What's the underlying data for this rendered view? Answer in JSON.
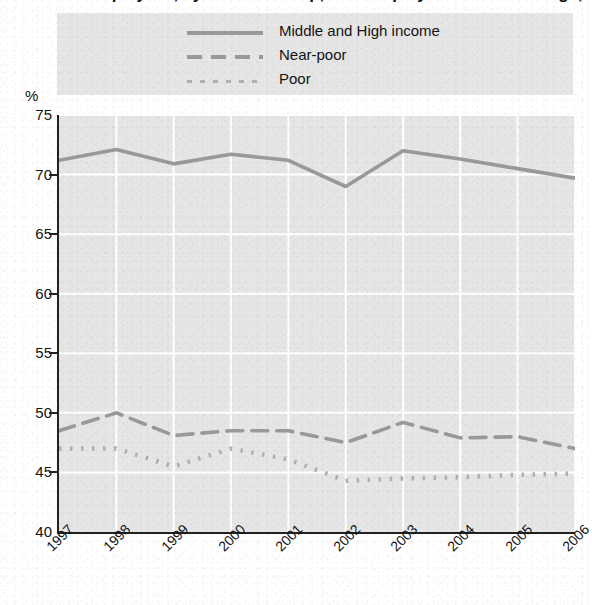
{
  "figure": {
    "title_remnant": "Percent of Employees, by Income Group, with Employer Health Coverage,",
    "percent_symbol": "%"
  },
  "legend": {
    "items": [
      {
        "label": "Middle and High income",
        "style": "solid",
        "color": "#9a9a9a"
      },
      {
        "label": "Near-poor",
        "style": "dashed",
        "color": "#9a9a9a"
      },
      {
        "label": "Poor",
        "style": "dotted",
        "color": "#b0b0b0"
      }
    ]
  },
  "axes": {
    "y_ticks": [
      "75",
      "70",
      "65",
      "60",
      "55",
      "50",
      "45",
      "40"
    ],
    "x_ticks": [
      "1997",
      "1998",
      "1999",
      "2000",
      "2001",
      "2002",
      "2003",
      "2004",
      "2005",
      "2006"
    ]
  },
  "chart_data": {
    "type": "line",
    "title": "Percent of Employees, by Income Group, with Employer Health Coverage,",
    "xlabel": "",
    "ylabel": "%",
    "ylim": [
      40,
      75
    ],
    "ytick_step": 5,
    "grid": true,
    "legend_position": "top",
    "x": [
      "1997",
      "1998",
      "1999",
      "2000",
      "2001",
      "2002",
      "2003",
      "2004",
      "2005",
      "2006"
    ],
    "series": [
      {
        "name": "Middle and High income",
        "style": "solid",
        "color": "#9a9a9a",
        "values": [
          71.2,
          72.1,
          70.9,
          71.7,
          71.2,
          69.0,
          72.0,
          71.3,
          70.5,
          69.7
        ]
      },
      {
        "name": "Near-poor",
        "style": "dashed",
        "color": "#9a9a9a",
        "values": [
          48.5,
          50.0,
          48.1,
          48.5,
          48.5,
          47.5,
          49.2,
          47.9,
          48.0,
          47.0
        ]
      },
      {
        "name": "Poor",
        "style": "dotted",
        "color": "#b0b0b0",
        "values": [
          47.0,
          47.0,
          45.5,
          47.0,
          46.1,
          44.3,
          44.5,
          44.6,
          44.8,
          44.9
        ]
      }
    ]
  }
}
